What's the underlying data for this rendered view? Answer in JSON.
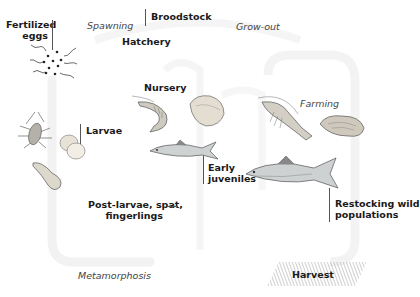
{
  "diagram": {
    "phases": {
      "spawning": "Spawning",
      "grow_out": "Grow-out",
      "farming": "Farming",
      "metamorphosis": "Metamorphosis"
    },
    "facilities": {
      "hatchery": "Hatchery",
      "nursery": "Nursery",
      "harvest": "Harvest"
    },
    "stages": {
      "broodstock": "Broodstock",
      "fertilized_eggs_line1": "Fertilized",
      "fertilized_eggs_line2": "eggs",
      "larvae": "Larvae",
      "post_larvae_line1": "Post-larvae, spat,",
      "post_larvae_line2": "fingerlings",
      "early_juveniles_line1": "Early",
      "early_juveniles_line2": "juveniles",
      "restocking_line1": "Restocking wild",
      "restocking_line2": "populations"
    },
    "illustrations": [
      "sperm-and-eggs",
      "larva-zoea",
      "bivalve-larvae",
      "tadpole-larva",
      "juvenile-shrimp",
      "juvenile-clam",
      "juvenile-fish",
      "adult-shrimp",
      "adult-oyster",
      "adult-fish"
    ],
    "colors": {
      "text": "#1a1a1a",
      "italic_text": "#444444",
      "cycle_arrow": "#f0f0f0",
      "illustration_stroke": "#555555",
      "harvest_hatch": "#9a9a9a"
    }
  }
}
